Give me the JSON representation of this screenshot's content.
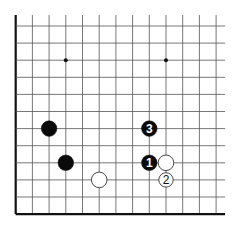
{
  "diagram": {
    "type": "go-board-partial",
    "grid": {
      "columns": 13,
      "rows": 12,
      "origin_x": 15.7,
      "origin_y": 26,
      "spacing_x": 16.7,
      "spacing_y": 17.1,
      "line_color": "#555555",
      "edge_color": "#111111",
      "thick_edges": [
        "left",
        "bottom"
      ],
      "open_edges": [
        "top",
        "right"
      ]
    },
    "star_points": [
      {
        "col": 3,
        "row": 2
      },
      {
        "col": 9,
        "row": 2
      }
    ],
    "stones": [
      {
        "color": "black",
        "col": 2,
        "row": 6,
        "label": ""
      },
      {
        "color": "black",
        "col": 3,
        "row": 8,
        "label": ""
      },
      {
        "color": "white",
        "col": 5,
        "row": 9,
        "label": ""
      },
      {
        "color": "black",
        "col": 8,
        "row": 8,
        "label": "1"
      },
      {
        "color": "white",
        "col": 9,
        "row": 9,
        "label": "2"
      },
      {
        "color": "black",
        "col": 8,
        "row": 6,
        "label": "3"
      },
      {
        "color": "white",
        "col": 9,
        "row": 8,
        "label": ""
      }
    ],
    "colors": {
      "black_stone": "#0a0a0a",
      "white_stone": "#ffffff",
      "white_stone_outline": "#333333",
      "black_label": "#ffffff",
      "white_label": "#111111"
    }
  }
}
